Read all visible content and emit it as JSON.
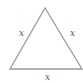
{
  "diagram": {
    "shape": "equilateral-triangle",
    "stroke_color": "#9a9a9a",
    "label_color": "#555555",
    "vertices": [
      [
        45,
        8
      ],
      [
        10,
        69
      ],
      [
        82,
        69
      ]
    ],
    "labels": {
      "left_side": "x",
      "right_side": "x",
      "bottom_side": "x"
    }
  }
}
